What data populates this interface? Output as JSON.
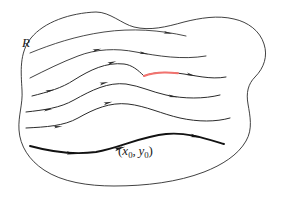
{
  "figure": {
    "background_color": "#ffffff",
    "width": 281,
    "height": 198,
    "region": {
      "name": "region-boundary",
      "label": "R",
      "label_x": 22,
      "label_y": 47,
      "label_font_size": 13,
      "stroke_color": "#2b2b2b",
      "stroke_width": 0.9,
      "fill_color": "#ffffff",
      "path": "M 96 12 C 70 13, 44 22, 31 38 C 19 53, 21 72, 22 90 C 23 104, 18 116, 19 130 C 20 146, 29 160, 44 170 C 62 182, 88 186, 114 186 C 146 186, 178 182, 204 172 C 222 165, 238 155, 246 141 C 253 129, 250 116, 248 104 C 246 93, 248 84, 255 77 C 264 68, 268 56, 264 44 C 260 31, 248 22, 234 19 C 218 15, 200 18, 184 22 C 166 27, 150 31, 134 27 C 122 24, 110 12, 96 12 Z"
    },
    "point_label": {
      "name": "initial-point-label",
      "open_paren": "(",
      "x_symbol": "x",
      "x_subscript": "0",
      "separator": ",",
      "y_symbol": "y",
      "y_subscript": "0",
      "close_paren": ")",
      "text": "(x0, y0)",
      "x": 118,
      "y": 155,
      "font_size": 13
    },
    "highlight_segment": {
      "name": "highlighted-arc-segment",
      "color": "#f2736f",
      "stroke_width": 2.0,
      "on_curve_index": 2,
      "path": "M 144 76 C 152 72.5, 164 71.6, 178 73.2"
    },
    "curves": [
      {
        "name": "flow-curve-1",
        "index": 0,
        "stroke_color": "#2b2b2b",
        "stroke_width": 0.85,
        "path": "M 30 53 C 52 44, 76 36, 104 32 C 132 28, 160 30, 186 36",
        "arrows": [
          {
            "x": 168,
            "y": 33.0,
            "angle": 10
          }
        ]
      },
      {
        "name": "flow-curve-2",
        "index": 1,
        "stroke_color": "#2b2b2b",
        "stroke_width": 0.9,
        "path": "M 30 78 C 46 70, 62 62, 78 56 C 96 49, 116 48, 136 52 C 158 56, 182 60, 206 56",
        "arrows": [
          {
            "x": 97,
            "y": 49.8,
            "angle": -14
          },
          {
            "x": 144,
            "y": 53.4,
            "angle": 12
          }
        ]
      },
      {
        "name": "flow-curve-3",
        "index": 2,
        "stroke_color": "#2b2b2b",
        "stroke_width": 1.0,
        "path": "M 32 96 C 48 92, 62 88, 74 80 C 90 70, 106 62, 124 64 C 132 65, 138 70, 144 76 C 152 72.5, 164 71.6, 178 73.2 C 194 75, 210 80, 226 77",
        "arrows": [
          {
            "x": 50,
            "y": 90.6,
            "angle": -14
          },
          {
            "x": 112,
            "y": 62.6,
            "angle": -16
          },
          {
            "x": 191,
            "y": 74.9,
            "angle": 14
          }
        ]
      },
      {
        "name": "flow-curve-4",
        "index": 3,
        "stroke_color": "#2b2b2b",
        "stroke_width": 1.0,
        "path": "M 26 112 C 44 110, 60 108, 74 100 C 92 90, 108 82, 126 84 C 140 86, 152 92, 166 95 C 184 99, 204 99, 220 95",
        "arrows": [
          {
            "x": 48,
            "y": 109.6,
            "angle": -8
          },
          {
            "x": 104,
            "y": 83.0,
            "angle": -14
          },
          {
            "x": 173,
            "y": 96.5,
            "angle": 10
          }
        ]
      },
      {
        "name": "flow-curve-5",
        "index": 4,
        "stroke_color": "#2b2b2b",
        "stroke_width": 1.0,
        "path": "M 26 128 C 46 127, 64 126, 78 118 C 94 109, 110 102, 128 104 C 146 106, 162 114, 180 118 C 198 122, 216 122, 230 118",
        "arrows": [
          {
            "x": 58,
            "y": 126.8,
            "angle": -6
          },
          {
            "x": 108,
            "y": 102.8,
            "angle": -14
          }
        ]
      },
      {
        "name": "flow-curve-6",
        "index": 5,
        "stroke_color": "#121212",
        "stroke_width": 1.9,
        "path": "M 30 146 C 52 152, 74 155, 96 152 C 120 148, 142 136, 166 134 C 186 132, 204 138, 224 144",
        "arrows": [
          {
            "x": 72,
            "y": 153.4,
            "angle": 6
          },
          {
            "x": 120,
            "y": 148.2,
            "angle": -16
          },
          {
            "x": 196,
            "y": 136.6,
            "angle": 12
          }
        ]
      }
    ]
  }
}
